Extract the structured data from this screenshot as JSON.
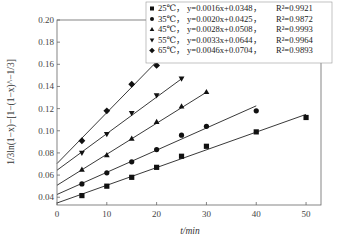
{
  "chart_data": {
    "type": "scatter",
    "title": "",
    "xlabel": "t/min",
    "ylabel": "1/3ln(1−x)−[1−(1−x)^−1/3]",
    "xlim": [
      0,
      53
    ],
    "ylim": [
      0.033,
      0.2
    ],
    "x_ticks": [
      0,
      10,
      20,
      30,
      40,
      50
    ],
    "y_ticks": [
      0.04,
      0.06,
      0.08,
      0.1,
      0.12,
      0.14,
      0.16,
      0.18,
      0.2
    ],
    "y_tick_labels": [
      "0.04",
      "0.06",
      "0.08",
      "0.10",
      "0.12",
      "0.14",
      "0.16",
      "0.18",
      "0.20"
    ],
    "grid": false,
    "legend_position": "upper right",
    "series": [
      {
        "name": "25℃",
        "marker": "square",
        "equation": "y=0.0016x+0.0348",
        "r2": "R²=0.9921",
        "slope": 0.0016,
        "intercept": 0.0348,
        "x": [
          5,
          10,
          15,
          20,
          25,
          30,
          40,
          50
        ],
        "values": [
          0.0415,
          0.05,
          0.058,
          0.067,
          0.077,
          0.086,
          0.099,
          0.112
        ],
        "fit_range": [
          0,
          50
        ]
      },
      {
        "name": "35℃",
        "marker": "circle",
        "equation": "y=0.0020x+0.0425",
        "r2": "R²=0.9872",
        "slope": 0.002,
        "intercept": 0.0425,
        "x": [
          5,
          10,
          15,
          20,
          25,
          30,
          40
        ],
        "values": [
          0.052,
          0.062,
          0.072,
          0.083,
          0.096,
          0.104,
          0.118
        ],
        "fit_range": [
          0,
          40
        ]
      },
      {
        "name": "45℃",
        "marker": "triangle-up",
        "equation": "y=0.0028x+0.0508",
        "r2": "R²=0.9993",
        "slope": 0.0028,
        "intercept": 0.0508,
        "x": [
          5,
          10,
          15,
          20,
          25,
          30
        ],
        "values": [
          0.065,
          0.078,
          0.093,
          0.108,
          0.122,
          0.135
        ],
        "fit_range": [
          0,
          30
        ]
      },
      {
        "name": "55℃",
        "marker": "triangle-down",
        "equation": "y=0.0033x+0.0644",
        "r2": "R²=0.9964",
        "slope": 0.0033,
        "intercept": 0.0644,
        "x": [
          5,
          10,
          15,
          20,
          25
        ],
        "values": [
          0.08,
          0.097,
          0.116,
          0.132,
          0.147
        ],
        "fit_range": [
          0,
          25
        ]
      },
      {
        "name": "65℃",
        "marker": "diamond",
        "equation": "y=0.0046x+0.0704",
        "r2": "R²=0.9893",
        "slope": 0.0046,
        "intercept": 0.0704,
        "x": [
          5,
          10,
          15,
          20
        ],
        "values": [
          0.091,
          0.118,
          0.142,
          0.159
        ],
        "fit_range": [
          0,
          20
        ]
      }
    ]
  }
}
